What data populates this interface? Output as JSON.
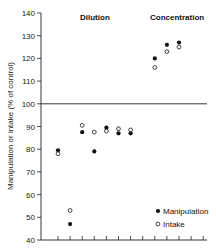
{
  "chart_data": {
    "type": "scatter",
    "title": "",
    "xlabel": "",
    "ylabel": "Manipulation or intake (% of control)",
    "ylim": [
      40,
      140
    ],
    "yticks": [
      40,
      50,
      60,
      70,
      80,
      90,
      100,
      110,
      120,
      130,
      140
    ],
    "x_ticks_count": 13,
    "reference_line": 100,
    "grid": false,
    "sections": [
      {
        "label": "Dilution",
        "x_positions": [
          1,
          2,
          3,
          4,
          5,
          6,
          7
        ]
      },
      {
        "label": "Concentration",
        "x_positions": [
          9,
          10,
          11
        ]
      }
    ],
    "x": [
      1,
      2,
      3,
      4,
      5,
      6,
      7,
      9,
      10,
      11
    ],
    "series": [
      {
        "name": "Manipulation",
        "marker": "filled-circle",
        "values": [
          79.5,
          47,
          87.5,
          79,
          89.5,
          87,
          87,
          120,
          126,
          127
        ]
      },
      {
        "name": "Intake",
        "marker": "open-circle",
        "values": [
          78,
          53,
          90.5,
          87.5,
          88,
          89,
          88.5,
          116,
          123,
          125
        ]
      }
    ],
    "legend_position": "lower-right"
  },
  "labels": {
    "ylabel": "Manipulation or intake (% of control)",
    "dilution": "Dilution",
    "concentration": "Concentration",
    "legend_manipulation": "Manipulation",
    "legend_intake": "Intake"
  }
}
